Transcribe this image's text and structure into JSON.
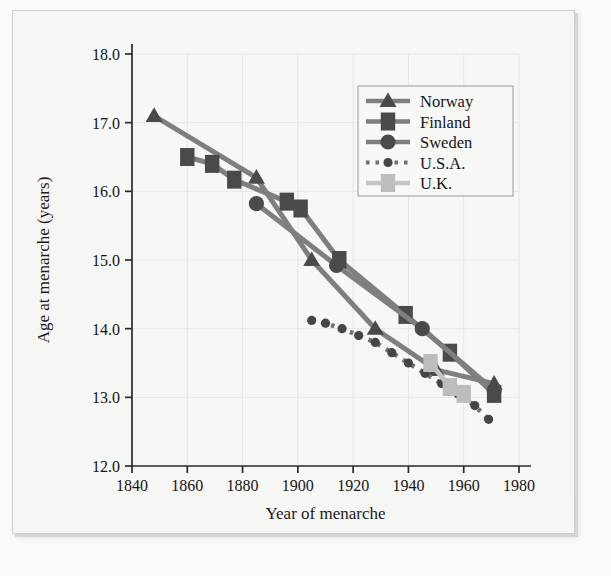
{
  "figure": {
    "background_color": "#f6f6f4",
    "frame_color": "#cfcfcf"
  },
  "chart_data": {
    "type": "line",
    "title": "",
    "xlabel": "Year of menarche",
    "ylabel": "Age at menarche (years)",
    "xlim": [
      1840,
      1980
    ],
    "ylim": [
      12.0,
      18.0
    ],
    "xticks": [
      1840,
      1860,
      1880,
      1900,
      1920,
      1940,
      1960,
      1980
    ],
    "yticks": [
      12.0,
      13.0,
      14.0,
      15.0,
      16.0,
      17.0,
      18.0
    ],
    "xtick_labels": [
      "1840",
      "1860",
      "1880",
      "1900",
      "1920",
      "1940",
      "1960",
      "1980"
    ],
    "ytick_labels": [
      "12.0",
      "13.0",
      "14.0",
      "15.0",
      "16.0",
      "17.0",
      "18.0"
    ],
    "grid": true,
    "legend_position": "upper right",
    "line_color": "#7f7f7f",
    "marker_color": "#4f4f4f",
    "series": [
      {
        "name": "Norway",
        "marker": "triangle",
        "linestyle": "solid",
        "color": "#7f7f7f",
        "marker_color": "#4a4a4a",
        "x": [
          1848,
          1885,
          1905,
          1928,
          1950,
          1971
        ],
        "y": [
          17.1,
          16.2,
          15.0,
          14.0,
          13.4,
          13.2
        ]
      },
      {
        "name": "Finland",
        "marker": "square",
        "linestyle": "solid",
        "color": "#7f7f7f",
        "marker_color": "#4a4a4a",
        "x": [
          1860,
          1869,
          1877,
          1896,
          1901,
          1915,
          1939,
          1955,
          1971
        ],
        "y": [
          16.5,
          16.4,
          16.17,
          15.85,
          15.75,
          15.0,
          14.2,
          13.65,
          13.05
        ]
      },
      {
        "name": "Sweden",
        "marker": "circle",
        "linestyle": "solid",
        "color": "#7f7f7f",
        "marker_color": "#4a4a4a",
        "x": [
          1885,
          1914,
          1945,
          1971
        ],
        "y": [
          15.82,
          14.92,
          14.0,
          13.1
        ]
      },
      {
        "name": "U.S.A.",
        "marker": "circle-small",
        "linestyle": "dotted",
        "color": "#6f6f6f",
        "marker_color": "#454545",
        "x": [
          1905,
          1910,
          1916,
          1922,
          1928,
          1934,
          1940,
          1946,
          1952,
          1958,
          1964,
          1969
        ],
        "y": [
          14.12,
          14.08,
          14.0,
          13.9,
          13.8,
          13.65,
          13.5,
          13.35,
          13.2,
          13.05,
          12.88,
          12.68
        ]
      },
      {
        "name": "U.K.",
        "marker": "square",
        "linestyle": "solid",
        "color": "#c4c4c4",
        "marker_color": "#bdbdbd",
        "x": [
          1948,
          1955,
          1960
        ],
        "y": [
          13.5,
          13.15,
          13.05
        ]
      }
    ]
  },
  "legend": {
    "entries": [
      {
        "label": "Norway",
        "marker": "triangle",
        "style": "solid",
        "color": "#7f7f7f",
        "marker_color": "#4a4a4a"
      },
      {
        "label": "Finland",
        "marker": "square",
        "style": "solid",
        "color": "#7f7f7f",
        "marker_color": "#4a4a4a"
      },
      {
        "label": "Sweden",
        "marker": "circle",
        "style": "solid",
        "color": "#7f7f7f",
        "marker_color": "#4a4a4a"
      },
      {
        "label": "U.S.A.",
        "marker": "circle-small",
        "style": "dotted",
        "color": "#6f6f6f",
        "marker_color": "#454545"
      },
      {
        "label": "U.K.",
        "marker": "square",
        "style": "solid",
        "color": "#c4c4c4",
        "marker_color": "#bdbdbd"
      }
    ]
  }
}
